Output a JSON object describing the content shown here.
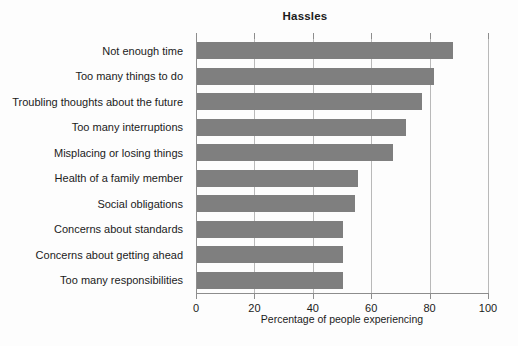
{
  "chart_data": {
    "type": "bar",
    "orientation": "horizontal",
    "title": "Hassles",
    "xlabel": "Percentage of people experiencing",
    "ylabel": "",
    "xlim": [
      0,
      100
    ],
    "xticks": [
      0,
      20,
      40,
      60,
      80,
      100
    ],
    "xtick_labels": [
      "0",
      "20",
      "40",
      "60",
      "80",
      "100"
    ],
    "grid": true,
    "grid_axis": "x",
    "legend": null,
    "bar_color": "#7f7f7f",
    "background_color": "#fdfdfd",
    "axis_color": "#8d8d8d",
    "gridline_color": "#b9b9b9",
    "text_color": "#1b1b1b",
    "categories": [
      "Not enough time",
      "Too many things to do",
      "Troubling thoughts about the future",
      "Too many interruptions",
      "Misplacing or losing things",
      "Health of a family member",
      "Social obligations",
      "Concerns about standards",
      "Concerns about getting ahead",
      "Too many responsibilities"
    ],
    "values": [
      87.5,
      81,
      77,
      71.5,
      67,
      55,
      54,
      50,
      50,
      50
    ]
  }
}
